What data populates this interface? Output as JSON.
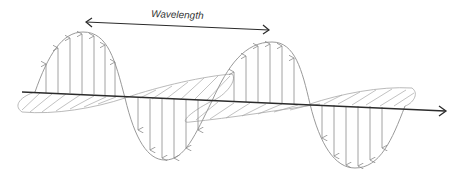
{
  "diagram": {
    "wavelength_label": "Wavelength",
    "colors": {
      "axis": "#2b2b2b",
      "wave_stroke": "#9a9a9a",
      "field_arrow": "#8a8a8a",
      "hatch": "#a8a8a8",
      "label": "#333333",
      "background": "#ffffff"
    },
    "elements": [
      {
        "name": "propagation-axis",
        "description": "horizontal axis arrow pointing right"
      },
      {
        "name": "wavelength-arrow",
        "description": "double-headed arrow spanning one wavelength"
      },
      {
        "name": "electric-field-wave",
        "description": "vertical sinusoid with vertical field arrows"
      },
      {
        "name": "magnetic-field-wave",
        "description": "horizontal sinusoid drawn in perspective with hatched arrows"
      }
    ]
  }
}
